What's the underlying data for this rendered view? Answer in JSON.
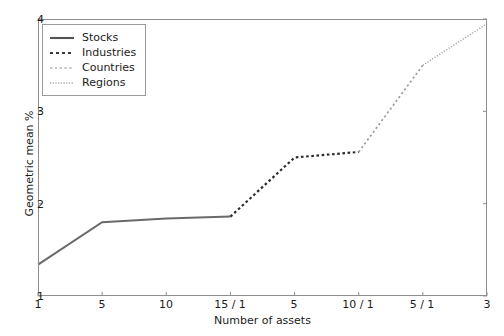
{
  "chart_data": {
    "type": "line",
    "title": "",
    "xlabel": "Number of assets",
    "ylabel": "Geometric mean %",
    "xticklabels": [
      "1",
      "5",
      "10",
      "15 / 1",
      "5",
      "10 / 1",
      "5 / 1",
      "3"
    ],
    "yticklabels": [
      "1",
      "2",
      "3",
      "4"
    ],
    "ylim": [
      1,
      4
    ],
    "grid": false,
    "legend_position": "upper left",
    "line_color": "#555555",
    "frame_color": "#8d8d8d",
    "series": [
      {
        "name": "Stocks",
        "style": "solid",
        "x": [
          0,
          1,
          2,
          3
        ],
        "values": [
          1.34,
          1.8,
          1.84,
          1.86
        ]
      },
      {
        "name": "Industries",
        "style": "dashed",
        "x": [
          3,
          4,
          5
        ],
        "values": [
          1.86,
          2.5,
          2.56
        ]
      },
      {
        "name": "Countries",
        "style": "dashdot",
        "x": [
          5,
          6
        ],
        "values": [
          2.56,
          3.5
        ]
      },
      {
        "name": "Regions",
        "style": "dotted",
        "x": [
          6,
          7
        ],
        "values": [
          3.5,
          3.95
        ]
      }
    ]
  },
  "legend": {
    "entries": [
      {
        "label": "Stocks"
      },
      {
        "label": "Industries"
      },
      {
        "label": "Countries"
      },
      {
        "label": "Regions"
      }
    ]
  }
}
